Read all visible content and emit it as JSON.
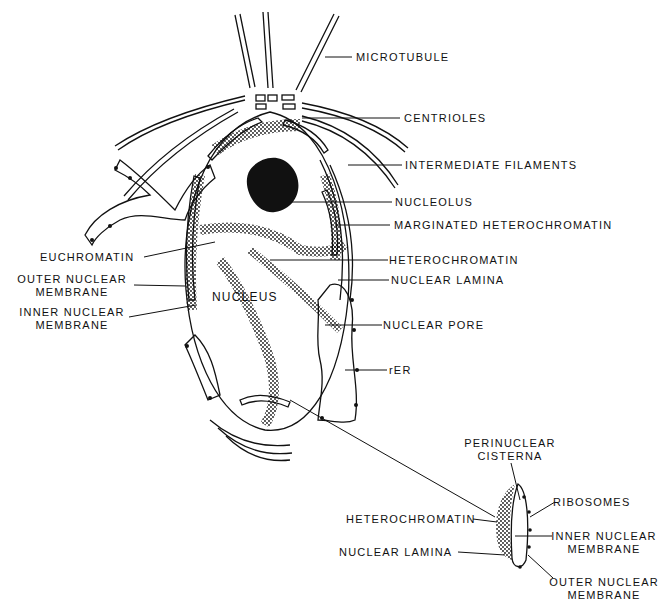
{
  "labels": {
    "microtubule": "MICROTUBULE",
    "centrioles": "CENTRIOLES",
    "intermediate_filaments": "INTERMEDIATE FILAMENTS",
    "nucleolus": "NUCLEOLUS",
    "marginated_heterochromatin": "MARGINATED HETEROCHROMATIN",
    "euchromatin": "EUCHROMATIN",
    "heterochromatin": "HETEROCHROMATIN",
    "outer_nuclear_membrane_1": "OUTER NUCLEAR",
    "outer_nuclear_membrane_2": "MEMBRANE",
    "nuclear_lamina": "NUCLEAR LAMINA",
    "nucleus": "NUCLEUS",
    "inner_nuclear_membrane_1": "INNER NUCLEAR",
    "inner_nuclear_membrane_2": "MEMBRANE",
    "nuclear_pore": "NUCLEAR PORE",
    "rer": "rER"
  },
  "inset": {
    "perinuclear_cisterna_1": "PERINUCLEAR",
    "perinuclear_cisterna_2": "CISTERNA",
    "ribosomes": "RIBOSOMES",
    "heterochromatin": "HETEROCHROMATIN",
    "inner_nuclear_membrane_1": "INNER NUCLEAR",
    "inner_nuclear_membrane_2": "MEMBRANE",
    "nuclear_lamina": "NUCLEAR LAMINA",
    "outer_nuclear_membrane_1": "OUTER NUCLEAR",
    "outer_nuclear_membrane_2": "MEMBRANE"
  },
  "colors": {
    "ink": "#111111",
    "background": "#ffffff"
  }
}
